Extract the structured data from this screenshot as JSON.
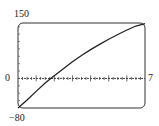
{
  "chart_data": {
    "type": "line",
    "title": "",
    "xlabel": "",
    "ylabel": "",
    "xlim": [
      0,
      7
    ],
    "ylim": [
      -80,
      150
    ],
    "grid": false,
    "x_ticks_major": [
      1,
      2,
      3,
      4,
      5,
      6
    ],
    "x_ticks_minor_step": 0.25,
    "y_ticks_step": 20,
    "tick_labels": {
      "y_top": "150",
      "y_zero": "0",
      "y_bottom": "−80",
      "x_right": "7"
    },
    "series": [
      {
        "name": "curve",
        "x": [
          0,
          0.5,
          1,
          1.5,
          1.8,
          2.5,
          3,
          3.5,
          4,
          4.5,
          5,
          5.5,
          6,
          6.5,
          7
        ],
        "values": [
          -80,
          -58,
          -35,
          -12,
          0,
          26,
          45,
          62,
          78,
          92,
          106,
          119,
          131,
          142,
          148
        ]
      }
    ]
  },
  "labels": {
    "y_top": "150",
    "y_zero": "0",
    "y_bottom": "−80",
    "x_right": "7"
  },
  "colors": {
    "frame": "#333333",
    "curve": "#222222",
    "axis": "#444444"
  }
}
